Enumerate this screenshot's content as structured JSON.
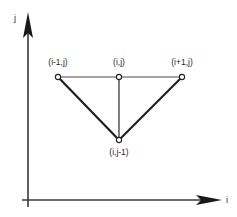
{
  "figure": {
    "type": "diagram",
    "title": "",
    "background_color": "#ffffff",
    "stroke_color": "#231f20",
    "axes": {
      "x": {
        "label": "i",
        "label_x": 226,
        "label_y": 196,
        "line": {
          "x1": 28,
          "y1": 200,
          "x2": 210,
          "y2": 200
        },
        "arrow": "right-arrowhead"
      },
      "y": {
        "label": "j",
        "label_x": 14,
        "label_y": 14,
        "line": {
          "x1": 28,
          "y1": 206,
          "x2": 28,
          "y2": 28
        },
        "arrow": "up-arrowhead"
      }
    },
    "nodes": [
      {
        "id": "left",
        "label": "(i-1,j)",
        "x": 58,
        "y": 77,
        "label_x": 58,
        "label_y": 58,
        "marker": "open-circle"
      },
      {
        "id": "center",
        "label": "(i,j)",
        "x": 119,
        "y": 77,
        "label_x": 119,
        "label_y": 58,
        "marker": "open-circle"
      },
      {
        "id": "right",
        "label": "(i+1,j)",
        "x": 182,
        "y": 77,
        "label_x": 182,
        "label_y": 58,
        "marker": "open-circle"
      },
      {
        "id": "bottom",
        "label": "(i,j-1)",
        "x": 119,
        "y": 140,
        "label_x": 119,
        "label_y": 148,
        "marker": "open-circle"
      }
    ],
    "edges": [
      {
        "from": "left",
        "to": "center",
        "weight": "thin",
        "width": 1
      },
      {
        "from": "center",
        "to": "right",
        "weight": "thin",
        "width": 1
      },
      {
        "from": "center",
        "to": "bottom",
        "weight": "thin",
        "width": 1.2
      },
      {
        "from": "left",
        "to": "bottom",
        "weight": "thick",
        "width": 2.2
      },
      {
        "from": "right",
        "to": "bottom",
        "weight": "thick",
        "width": 2.2
      }
    ]
  }
}
